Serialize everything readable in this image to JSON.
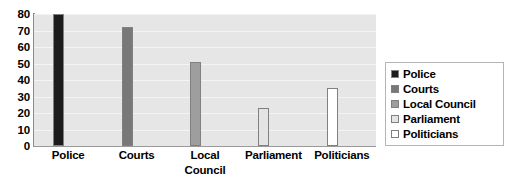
{
  "chart_data": {
    "type": "bar",
    "title": "",
    "xlabel": "",
    "ylabel": "",
    "ylim": [
      0,
      80
    ],
    "ytick_step": 10,
    "yticks": [
      "80",
      "70",
      "60",
      "50",
      "40",
      "30",
      "20",
      "10",
      "0"
    ],
    "grid": true,
    "legend_position": "right",
    "categories": [
      "Police",
      "Courts",
      "Local\nCouncil",
      "Parliament",
      "Politicians"
    ],
    "legend_labels": [
      "Police",
      "Courts",
      "Local Council",
      "Parliament",
      "Politicians"
    ],
    "values": [
      80,
      72,
      51,
      23,
      35
    ],
    "series": [
      {
        "name": "Confidence",
        "values": [
          80,
          72,
          51,
          23,
          35
        ]
      }
    ],
    "colors": {
      "police": "#1c1c1c",
      "courts": "#787878",
      "local_council": "#9e9e9e",
      "parliament": "#e4e4e4",
      "politicians": "#ffffff",
      "bar_outline": "#808080",
      "plot_background": "#e6e6e6",
      "gridline": "#f4f4f4",
      "axis": "#8c8c8c",
      "legend_border": "#b5b5b5",
      "text": "#000000"
    }
  }
}
